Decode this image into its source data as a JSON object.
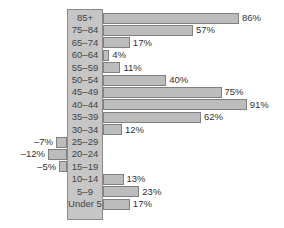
{
  "chart_data": {
    "type": "bar",
    "orientation": "horizontal",
    "title": "",
    "xlabel": "",
    "ylabel": "",
    "categories": [
      "85+",
      "75–84",
      "65–74",
      "60–64",
      "55–59",
      "50–54",
      "45–49",
      "40–44",
      "35–39",
      "30–34",
      "25–29",
      "20–24",
      "15–19",
      "10–14",
      "5–9",
      "Under 5"
    ],
    "values": [
      86,
      57,
      17,
      4,
      11,
      40,
      75,
      91,
      62,
      12,
      -7,
      -12,
      -5,
      13,
      23,
      17
    ],
    "value_labels": [
      "86%",
      "57%",
      "17%",
      "4%",
      "11%",
      "40%",
      "75%",
      "91%",
      "62%",
      "12%",
      "–7%",
      "–12%",
      "–5%",
      "13%",
      "23%",
      "17%"
    ],
    "units": "%",
    "grid": false,
    "legend": null,
    "colors": {
      "bar": "#bcbcbc",
      "bar_border": "#808080",
      "label_column": "#c6c6c6",
      "text": "#333333"
    }
  }
}
